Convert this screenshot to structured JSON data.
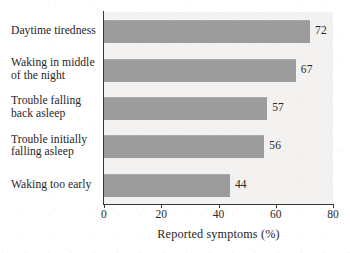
{
  "chart_data": {
    "type": "bar",
    "orientation": "horizontal",
    "title": "",
    "xlabel": "Reported symptoms (%)",
    "ylabel": "",
    "xlim": [
      0,
      80
    ],
    "xticks": [
      "0",
      "20",
      "40",
      "60",
      "80"
    ],
    "grid": false,
    "legend": null,
    "categories": [
      "Daytime tiredness",
      "Waking in middle of the night",
      "Trouble falling back asleep",
      "Trouble initially falling asleep",
      "Waking too early"
    ],
    "category_lines": [
      [
        "Daytime tiredness"
      ],
      [
        "Waking in middle",
        "of the night"
      ],
      [
        "Trouble falling",
        "back asleep"
      ],
      [
        "Trouble initially",
        "falling asleep"
      ],
      [
        "Waking too early"
      ]
    ],
    "values": [
      72,
      67,
      57,
      56,
      44
    ],
    "value_labels": [
      "72",
      "67",
      "57",
      "56",
      "44"
    ],
    "colors": {
      "bar": "#9c9c9c",
      "plot_background": "#f3f2f0",
      "page_background": "#ffffff",
      "axis": "#3a3833",
      "text": "#26241f"
    }
  }
}
